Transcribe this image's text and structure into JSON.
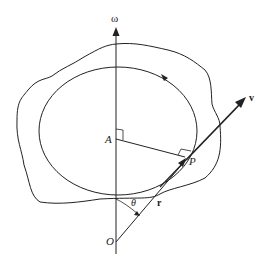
{
  "diagram": {
    "labels": {
      "omega": "ω",
      "axis_point": "A",
      "point": "P",
      "origin": "O",
      "velocity": "v",
      "position": "r",
      "angle": "θ"
    },
    "elements": [
      "rigid-body-outline",
      "rotation-axis",
      "circular-path",
      "radius-A-to-P",
      "position-vector-r",
      "velocity-vector-v",
      "angle-theta-arc"
    ],
    "colors": {
      "stroke": "#222222",
      "background": "#ffffff"
    }
  }
}
